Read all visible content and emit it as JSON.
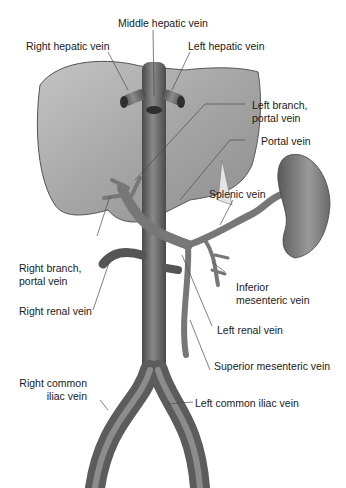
{
  "figure": {
    "colors": {
      "vessel": "#6e6e6e",
      "vessel_dark": "#3f3f3f",
      "liver": "#a9a9a9",
      "spleen": "#7a7a7a",
      "leader": "#4a4a4a",
      "text": "#1a1a1a"
    },
    "labels": {
      "middle_hepatic": "Middle hepatic vein",
      "right_hepatic": "Right hepatic vein",
      "left_hepatic": "Left hepatic vein",
      "left_branch_1": "Left branch,",
      "left_branch_2": "portal vein",
      "portal": "Portal vein",
      "splenic": "Splenic vein",
      "right_branch_1": "Right branch,",
      "right_branch_2": "portal vein",
      "inferior_mes_1": "Inferior",
      "inferior_mes_2": "mesenteric vein",
      "right_renal": "Right renal vein",
      "left_renal": "Left renal vein",
      "superior_mes": "Superior mesenteric vein",
      "right_iliac_1": "Right common",
      "right_iliac_2": "iliac vein",
      "left_iliac": "Left common iliac vein"
    }
  }
}
